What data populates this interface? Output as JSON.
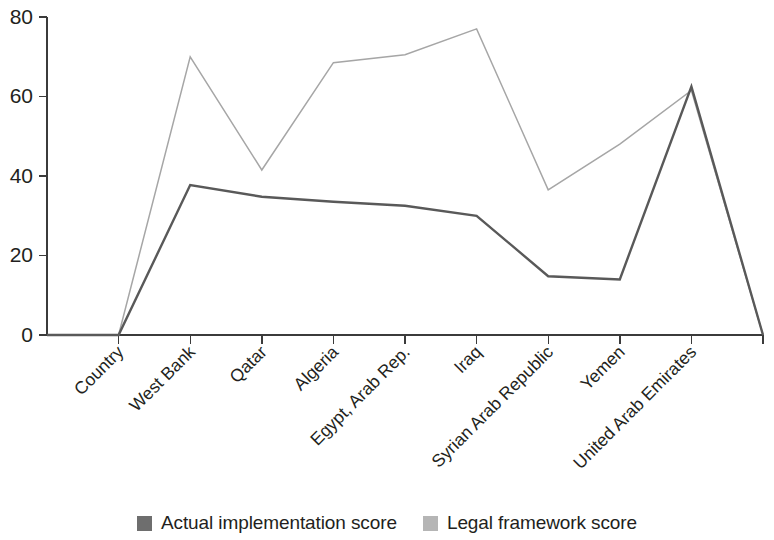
{
  "chart_data": {
    "type": "line",
    "title": "",
    "xlabel": "",
    "ylabel": "",
    "ylim": [
      0,
      80
    ],
    "yticks": [
      0,
      20,
      40,
      60,
      80
    ],
    "grid": false,
    "legend_position": "bottom-center",
    "categories": [
      "Country",
      "West Bank",
      "Qatar",
      "Algeria",
      "Egypt, Arab Rep.",
      "Iraq",
      "Syrian Arab Republic",
      "Yemen",
      "United Arab Emirates"
    ],
    "series": [
      {
        "name": "Actual implementation score",
        "color": "#595959",
        "values": [
          0,
          37.7,
          34.8,
          33.5,
          32.5,
          30.0,
          14.8,
          14.0,
          62.5
        ]
      },
      {
        "name": "Legal framework score",
        "color": "#a6a6a6",
        "values": [
          0,
          70.0,
          41.5,
          68.5,
          70.5,
          77.0,
          36.5,
          48.0,
          61.5
        ]
      }
    ],
    "leading_zero_segment": true,
    "trailing_zero_segment": true
  },
  "legend": {
    "items": [
      {
        "label": "Actual implementation score",
        "swatch": "dark-gray-swatch",
        "color": "#6e6e6e"
      },
      {
        "label": "Legal framework score",
        "swatch": "light-gray-swatch",
        "color": "#b5b5b5"
      }
    ]
  },
  "axis": {
    "y_tick_labels": [
      "80",
      "60",
      "40",
      "20",
      "0"
    ]
  }
}
